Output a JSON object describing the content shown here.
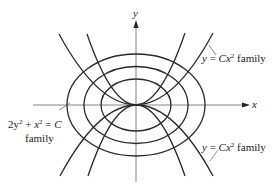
{
  "diagram": {
    "type": "orthogonal trajectories",
    "axes": {
      "x_label": "x",
      "y_label": "y"
    },
    "labels": {
      "parabola_top": {
        "var": "y",
        "eq": " = ",
        "coef": "C",
        "x": "x",
        "exp": "2",
        "suffix": " family"
      },
      "parabola_bottom": {
        "var": "y",
        "eq": " = ",
        "coef": "C",
        "x": "x",
        "exp": "2",
        "suffix": " family"
      },
      "ellipse": {
        "line1": "2y",
        "exp1": "2",
        "plus": " + ",
        "x": "x",
        "exp2": "2",
        "eq": " = ",
        "c": "C",
        "line2": "family"
      }
    },
    "families": [
      {
        "name": "ellipses",
        "equation": "2y^2 + x^2 = C",
        "count": 3
      },
      {
        "name": "parabolas",
        "equation": "y = Cx^2",
        "count": 4
      }
    ],
    "colors": {
      "curve": "#2a2a2a",
      "axis": "#555555",
      "text": "#222222",
      "background": "#ffffff"
    }
  }
}
